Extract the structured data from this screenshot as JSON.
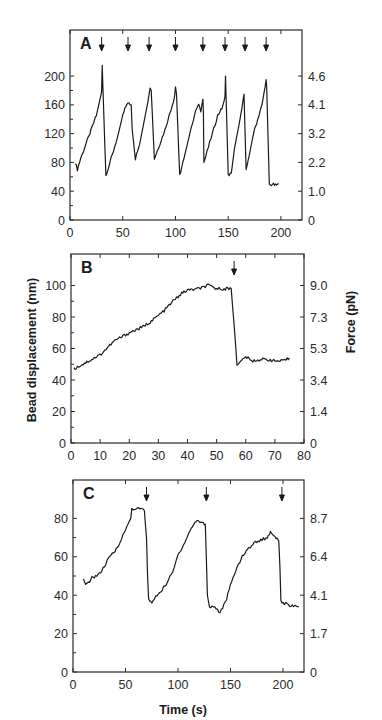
{
  "figure": {
    "ylabel_left": "Bead displacement (nm)",
    "ylabel_right": "Force (pN)",
    "xlabel": "Time (s)"
  },
  "chart_data": [
    {
      "type": "line",
      "panel": "A",
      "title": "",
      "xlabel": "",
      "ylabel": "Bead displacement (nm)",
      "ylabel_right": "Force (pN)",
      "xlim": [
        0,
        220
      ],
      "ylim": [
        0,
        264
      ],
      "xticks": [
        0,
        50,
        100,
        150,
        200
      ],
      "yticks": [
        0,
        40,
        80,
        120,
        160,
        200
      ],
      "yticks_right": [
        {
          "value": 0,
          "label": "0"
        },
        {
          "value": 40,
          "label": "1.0"
        },
        {
          "value": 80,
          "label": "2.2"
        },
        {
          "value": 120,
          "label": "3.2"
        },
        {
          "value": 160,
          "label": "4.1"
        },
        {
          "value": 200,
          "label": "4.6"
        }
      ],
      "arrows_x": [
        30,
        55,
        75,
        100,
        126,
        147,
        166,
        186
      ],
      "series": [
        {
          "name": "displacement",
          "x": [
            5,
            7,
            10,
            15,
            20,
            25,
            28,
            30,
            30.5,
            34,
            40,
            45,
            50,
            54,
            55,
            58,
            59,
            62,
            66,
            70,
            74,
            76,
            77,
            80,
            85,
            90,
            95,
            99,
            100,
            101,
            104,
            108,
            112,
            116,
            120,
            122,
            124,
            126,
            126.5,
            127,
            130,
            135,
            140,
            144,
            146,
            147,
            147.5,
            150,
            153,
            156,
            160,
            163,
            165,
            165.5,
            167,
            170,
            174,
            178,
            182,
            185,
            186,
            186.5,
            189,
            190,
            192,
            195,
            198
          ],
          "y": [
            80,
            70,
            85,
            105,
            125,
            145,
            165,
            178,
            215,
            62,
            90,
            115,
            145,
            162,
            162,
            160,
            125,
            85,
            105,
            135,
            165,
            185,
            180,
            85,
            105,
            125,
            150,
            170,
            185,
            175,
            62,
            85,
            110,
            135,
            155,
            160,
            150,
            168,
            150,
            80,
            95,
            120,
            145,
            155,
            165,
            172,
            200,
            62,
            65,
            100,
            130,
            155,
            175,
            150,
            70,
            90,
            120,
            140,
            160,
            185,
            195,
            185,
            50,
            48,
            50,
            48,
            50
          ]
        }
      ]
    },
    {
      "type": "line",
      "panel": "B",
      "title": "",
      "xlabel": "",
      "ylabel": "Bead displacement (nm)",
      "ylabel_right": "Force (pN)",
      "xlim": [
        0,
        80
      ],
      "ylim": [
        0,
        120
      ],
      "xticks": [
        0,
        10,
        20,
        30,
        40,
        50,
        60,
        70,
        80
      ],
      "yticks": [
        0,
        20,
        40,
        60,
        80,
        100
      ],
      "yticks_right": [
        {
          "value": 0,
          "label": "0"
        },
        {
          "value": 20,
          "label": "1.4"
        },
        {
          "value": 40,
          "label": "3.4"
        },
        {
          "value": 60,
          "label": "5.3"
        },
        {
          "value": 80,
          "label": "7.3"
        },
        {
          "value": 100,
          "label": "9.0"
        }
      ],
      "arrows_x": [
        56
      ],
      "series": [
        {
          "name": "displacement",
          "x": [
            1,
            5,
            8,
            10,
            15,
            20,
            25,
            28,
            32,
            35,
            38,
            40,
            44,
            47,
            50,
            53,
            55,
            56,
            57,
            58,
            60,
            62,
            65,
            68,
            70,
            73,
            75
          ],
          "y": [
            47,
            51,
            54,
            56,
            65,
            70,
            74,
            78,
            84,
            90,
            95,
            97,
            98,
            100,
            98,
            98,
            98,
            75,
            50,
            51,
            55,
            52,
            53,
            53,
            52,
            52,
            54
          ]
        }
      ]
    },
    {
      "type": "line",
      "panel": "C",
      "title": "",
      "xlabel": "Time (s)",
      "ylabel": "Bead displacement (nm)",
      "ylabel_right": "Force (pN)",
      "xlim": [
        0,
        220
      ],
      "ylim": [
        0,
        100
      ],
      "xticks": [
        0,
        50,
        100,
        150,
        200
      ],
      "yticks": [
        0,
        20,
        40,
        60,
        80
      ],
      "yticks_right": [
        {
          "value": 0,
          "label": "0"
        },
        {
          "value": 20,
          "label": "1.7"
        },
        {
          "value": 40,
          "label": "4.1"
        },
        {
          "value": 60,
          "label": "6.4"
        },
        {
          "value": 80,
          "label": "8.7"
        }
      ],
      "arrows_x": [
        70,
        127,
        199
      ],
      "series": [
        {
          "name": "displacement",
          "x": [
            10,
            12,
            18,
            25,
            30,
            35,
            40,
            45,
            50,
            55,
            56,
            60,
            65,
            68,
            70,
            71,
            72,
            75,
            80,
            85,
            90,
            95,
            100,
            105,
            110,
            115,
            118,
            122,
            126,
            127,
            128,
            130,
            135,
            140,
            145,
            150,
            155,
            160,
            165,
            170,
            175,
            180,
            185,
            188,
            192,
            196,
            197,
            198,
            200,
            205,
            210,
            215
          ],
          "y": [
            48,
            45,
            49,
            51,
            55,
            60,
            63,
            68,
            74,
            80,
            85,
            85,
            85,
            84,
            70,
            50,
            38,
            36,
            40,
            43,
            47,
            52,
            61,
            66,
            72,
            77,
            79,
            78,
            77,
            60,
            40,
            34,
            34,
            31,
            36,
            45,
            53,
            59,
            63,
            66,
            68,
            69,
            70,
            73,
            71,
            68,
            55,
            37,
            36,
            35,
            34,
            34
          ]
        }
      ]
    }
  ]
}
